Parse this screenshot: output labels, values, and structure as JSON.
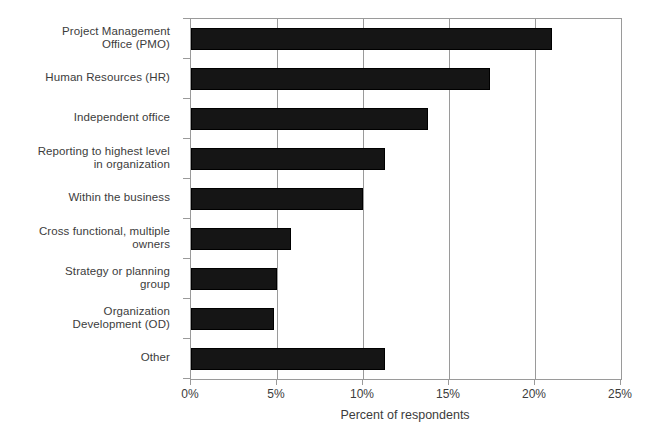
{
  "chart_data": {
    "type": "bar",
    "orientation": "horizontal",
    "title": "",
    "xlabel": "Percent of respondents",
    "ylabel": "",
    "xlim": [
      0,
      25
    ],
    "xtick_labels": [
      "0%",
      "5%",
      "10%",
      "15%",
      "20%",
      "25%"
    ],
    "xticks": [
      0,
      5,
      10,
      15,
      20,
      25
    ],
    "grid": true,
    "grid_axis": "x",
    "legend": null,
    "bar_color": "#151515",
    "axis_color": "#9a9a9a",
    "text_color": "#3c3c3c",
    "background": "#ffffff",
    "categories": [
      "Project Management\nOffice (PMO)",
      "Human Resources (HR)",
      "Independent office",
      "Reporting to highest level\nin organization",
      "Within the business",
      "Cross functional, multiple\nowners",
      "Strategy or planning\ngroup",
      "Organization\nDevelopment (OD)",
      "Other"
    ],
    "values": [
      21.0,
      17.4,
      13.8,
      11.3,
      10.0,
      5.8,
      5.0,
      4.8,
      11.3
    ]
  }
}
